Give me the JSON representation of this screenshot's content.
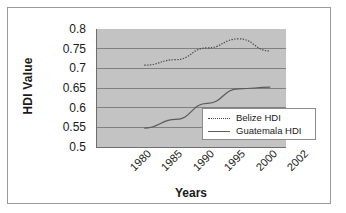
{
  "chart_data": {
    "type": "line",
    "title": "",
    "xlabel": "Years",
    "ylabel": "HDI Value",
    "categories": [
      "1980",
      "1985",
      "1990",
      "1995",
      "2000",
      "2002"
    ],
    "ylim": [
      0.5,
      0.8
    ],
    "yticks": [
      "0.8",
      "0.75",
      "0.7",
      "0.65",
      "0.6",
      "0.55",
      "0.5"
    ],
    "ytick_values": [
      0.8,
      0.75,
      0.7,
      0.65,
      0.6,
      0.55,
      0.5
    ],
    "grid": true,
    "legend_position": "lower-right inside plot",
    "plot_background": "#c3c3c3",
    "series": [
      {
        "name": "Belize HDI",
        "style": "dotted",
        "color": "#4a4a4a",
        "x": [
          "1985",
          "1990",
          "1995",
          "2000",
          "2002"
        ],
        "values": [
          0.708,
          0.722,
          0.752,
          0.775,
          0.744
        ]
      },
      {
        "name": "Guatemala HDI",
        "style": "solid",
        "color": "#5a5a5a",
        "x": [
          "1985",
          "1990",
          "1995",
          "2000",
          "2002"
        ],
        "values": [
          0.548,
          0.57,
          0.611,
          0.648,
          0.652
        ]
      }
    ]
  },
  "axis": {
    "y_title": "HDI Value",
    "x_title": "Years"
  },
  "legend": {
    "items": [
      {
        "label": "Belize HDI",
        "marker": "dotted-line-swatch"
      },
      {
        "label": "Guatemala HDI",
        "marker": "solid-line-swatch"
      }
    ]
  }
}
